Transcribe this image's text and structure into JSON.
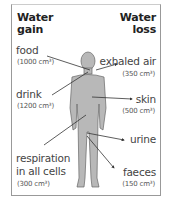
{
  "diagram": {
    "gain_heading": [
      "Water",
      "gain"
    ],
    "loss_heading": [
      "Water",
      "loss"
    ],
    "gains": [
      {
        "label": "food",
        "amount": "(1000 cm³)"
      },
      {
        "label": "drink",
        "amount": "(1200 cm³)"
      },
      {
        "label_lines": [
          "respiration",
          "in all cells"
        ],
        "amount": "(300 cm³)"
      }
    ],
    "losses": [
      {
        "label": "exhaled air",
        "amount": "(350 cm³)"
      },
      {
        "label": "skin",
        "amount": "(500 cm³)"
      },
      {
        "label": "urine",
        "amount": ""
      },
      {
        "label": "faeces",
        "amount": "(150 cm³)"
      }
    ],
    "colors": {
      "body_fill": "#b8b8b8",
      "body_stroke": "#666666",
      "line": "#333333",
      "border": "#999999"
    }
  }
}
